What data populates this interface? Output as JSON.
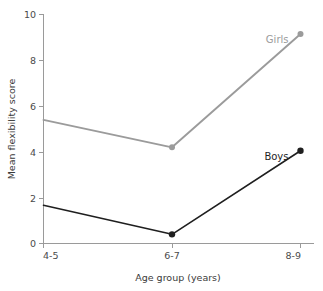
{
  "chart_data": {
    "type": "line",
    "title": "",
    "subtitle": "",
    "xlabel": "Age group (years)",
    "ylabel": "Mean flexibility score",
    "categories": [
      "4-5",
      "6-7",
      "8-9"
    ],
    "xticklabels": [
      "4-5",
      "6-7",
      "8-9"
    ],
    "yticklabels": [
      "0",
      "2",
      "4",
      "6",
      "8",
      "10"
    ],
    "yticks": [
      0,
      2,
      4,
      6,
      8,
      10
    ],
    "ylim": [
      0,
      10
    ],
    "xlim": [
      0,
      2
    ],
    "grid": false,
    "legend": "inline-labels",
    "series": [
      {
        "name": "Girls",
        "color": "#9b9b9b",
        "marker": "circle",
        "values": [
          5.4,
          4.2,
          9.15
        ]
      },
      {
        "name": "Boys",
        "color": "#1f1f1f",
        "marker": "circle",
        "values": [
          1.67,
          0.4,
          4.05
        ]
      }
    ],
    "annotations": [
      {
        "text": "Girls",
        "x": "8-9",
        "y": 9.15,
        "color": "#9b9b9b"
      },
      {
        "text": "Boys",
        "x": "8-9",
        "y": 4.05,
        "color": "#1f1f1f"
      }
    ]
  },
  "axis": {
    "y_label": "Mean flexibility score",
    "x_label": "Age group (years)",
    "y_ticks": [
      "10",
      "8",
      "6",
      "4",
      "2",
      "0"
    ],
    "x_ticks": [
      "4-5",
      "6-7",
      "8-9"
    ]
  },
  "series_labels": {
    "girls": "Girls",
    "boys": "Boys"
  },
  "colors": {
    "girls": "#9b9b9b",
    "boys": "#1f1f1f",
    "axis": "#9a9a9a",
    "text": "#3a3a3a",
    "background": "#ffffff"
  }
}
